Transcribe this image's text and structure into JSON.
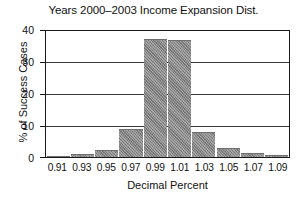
{
  "chart_data": {
    "type": "bar",
    "title": "Years 2000–2003 Income Expansion Dist.",
    "xlabel": "Decimal Percent",
    "ylabel": "% of Success Cases",
    "categories": [
      "0.91",
      "0.93",
      "0.95",
      "0.97",
      "0.99",
      "1.01",
      "1.03",
      "1.05",
      "1.07",
      "1.09"
    ],
    "values": [
      0.4,
      0.8,
      2.2,
      8.8,
      37.5,
      37.3,
      7.8,
      3.0,
      1.3,
      0.5
    ],
    "ylim": [
      0,
      40
    ],
    "yticks": [
      0,
      10,
      20,
      30,
      40
    ],
    "ytick_labels": [
      "0",
      "10",
      "20",
      "30",
      "40"
    ],
    "grid": "horizontal",
    "legend": "none",
    "bar_color": "#8d8d8d",
    "frame_color": "#1a1a1a",
    "background": "#ffffff"
  }
}
